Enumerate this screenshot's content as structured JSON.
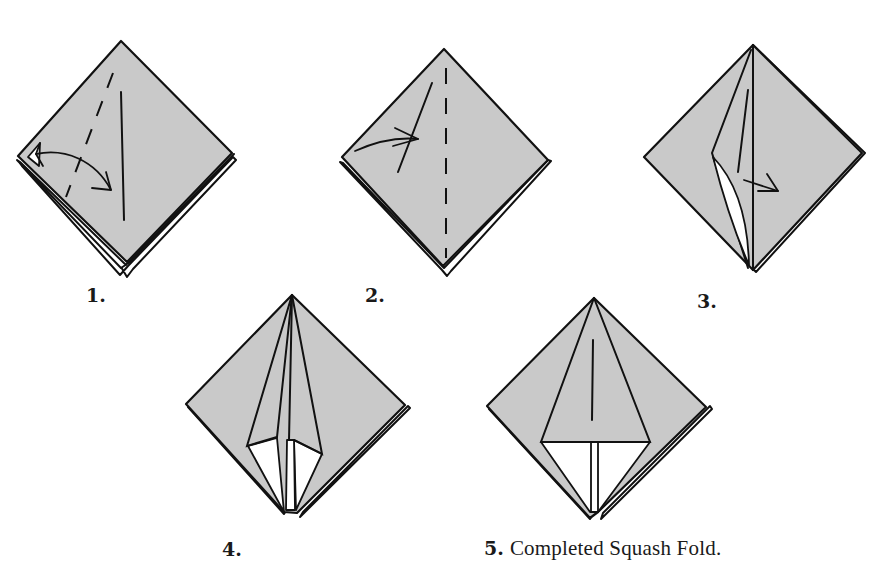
{
  "figure": {
    "background_color": "#ffffff",
    "paper_color": "#c9c9c9",
    "line_color": "#111111"
  },
  "steps": [
    {
      "number": "1.",
      "description": "",
      "icons": [
        "valley-fold-dashed-line",
        "fold-arrow",
        "crease-line"
      ]
    },
    {
      "number": "2.",
      "description": "",
      "icons": [
        "fold-arrow",
        "dashed-center-line",
        "crease-line"
      ]
    },
    {
      "number": "3.",
      "description": "",
      "icons": [
        "squash-arrow",
        "open-pocket"
      ]
    },
    {
      "number": "4.",
      "description": "",
      "icons": [
        "partially-squashed-flap"
      ]
    },
    {
      "number": "5.",
      "description": "Completed Squash Fold.",
      "icons": [
        "completed-squash-fold"
      ]
    }
  ]
}
